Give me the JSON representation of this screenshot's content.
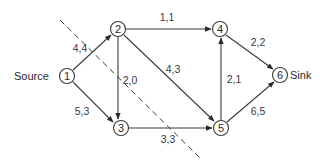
{
  "diagram": {
    "type": "flow-network",
    "nodes": [
      {
        "id": "1",
        "label": "1",
        "x": 67,
        "y": 76
      },
      {
        "id": "2",
        "label": "2",
        "x": 118,
        "y": 29
      },
      {
        "id": "3",
        "label": "3",
        "x": 121,
        "y": 128
      },
      {
        "id": "4",
        "label": "4",
        "x": 220,
        "y": 29
      },
      {
        "id": "5",
        "label": "5",
        "x": 221,
        "y": 128
      },
      {
        "id": "6",
        "label": "6",
        "x": 280,
        "y": 75
      }
    ],
    "node_annotations": {
      "source": "Source",
      "sink": "Sink"
    },
    "edges": [
      {
        "from": "1",
        "to": "2",
        "label": "4,4"
      },
      {
        "from": "1",
        "to": "3",
        "label": "5,3"
      },
      {
        "from": "2",
        "to": "4",
        "label": "1,1"
      },
      {
        "from": "2",
        "to": "3",
        "label": "2,0"
      },
      {
        "from": "2",
        "to": "5",
        "label": "4,3"
      },
      {
        "from": "3",
        "to": "5",
        "label": "3,3"
      },
      {
        "from": "5",
        "to": "4",
        "label": "2,1"
      },
      {
        "from": "4",
        "to": "6",
        "label": "2,2"
      },
      {
        "from": "5",
        "to": "6",
        "label": "6,5"
      }
    ],
    "cut_line": {
      "style": "dashed",
      "x1": 60,
      "y1": 20,
      "x2": 200,
      "y2": 158
    }
  }
}
